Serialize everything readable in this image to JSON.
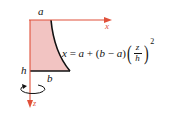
{
  "diagram": {
    "type": "solid-of-revolution-profile",
    "labels": {
      "top_width": "a",
      "bottom_width": "b",
      "height": "h",
      "x_axis": "x",
      "z_axis": "z"
    },
    "equation": {
      "lhs": "x",
      "eq": "=",
      "a": "a",
      "plus": "+",
      "open": "(",
      "b": "b",
      "minus": "−",
      "a2": "a",
      "close": ")",
      "num": "z",
      "den": "h",
      "exp": "2",
      "lparen": "(",
      "rparen": ")"
    },
    "colors": {
      "fill": "#f2c4c2",
      "axis": "#e0503a",
      "edge": "#111111"
    }
  }
}
